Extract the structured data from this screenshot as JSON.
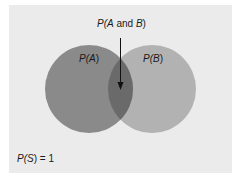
{
  "diagram": {
    "type": "venn",
    "colors": {
      "background": "#ebebeb",
      "circle_a": "#8a8a8a",
      "circle_b": "#b2b2b2",
      "overlap": "#6a6a6a",
      "text": "#1a1a1a"
    },
    "circles": [
      {
        "id": "A",
        "label": "P(A)",
        "cx": 89,
        "cy": 89,
        "r": 44
      },
      {
        "id": "B",
        "label": "P(B)",
        "cx": 152,
        "cy": 89,
        "r": 44
      }
    ],
    "intersection_label": "P(A and B)",
    "sample_space_label": "P(S) = 1"
  },
  "labels": {
    "a_fn": "P(",
    "a_var": "A",
    "a_close": ")",
    "b_fn": "P(",
    "b_var": "B",
    "b_close": ")",
    "ab_fn": "P(",
    "ab_var1": "A",
    "ab_mid": " and ",
    "ab_var2": "B",
    "ab_close": ")",
    "s_fn": "P(",
    "s_var": "S",
    "s_close": ") = 1"
  }
}
